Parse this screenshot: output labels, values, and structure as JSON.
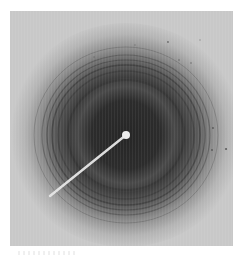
{
  "image": {
    "subject": "X-ray diffraction pattern",
    "description": "Concentric diffraction rings around a dark central halo with a beam-stop arm extending to the lower left",
    "center": {
      "x": 126,
      "y": 135
    },
    "beam_stop": {
      "tip_radius": 4,
      "arm_end": {
        "x": 50,
        "y": 196
      }
    },
    "rings": [
      {
        "radius": 58,
        "darkness": 0.55
      },
      {
        "radius": 68,
        "darkness": 0.45
      },
      {
        "radius": 74,
        "darkness": 0.5
      },
      {
        "radius": 79,
        "darkness": 0.45
      },
      {
        "radius": 84,
        "darkness": 0.4
      },
      {
        "radius": 92,
        "darkness": 0.3
      }
    ],
    "colors": {
      "background": "#c8c8c8",
      "halo_dark": "#2a2a2a",
      "halo_mid": "#555555",
      "ring": "#3a3a3a",
      "beam_stop": "#e8e8e8"
    }
  }
}
